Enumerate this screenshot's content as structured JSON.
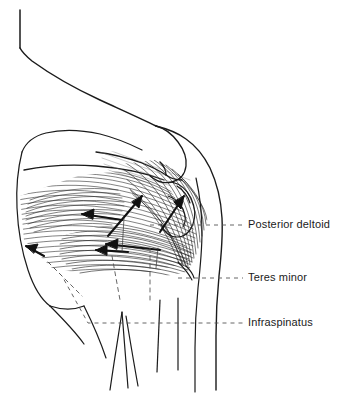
{
  "figure": {
    "background_color": "#ffffff",
    "ink_color": "#1b1b1b",
    "leader_color": "#555555",
    "width": 351,
    "height": 395
  },
  "labels": [
    {
      "id": "posterior-deltoid",
      "text": "Posterior deltoid",
      "x": 248,
      "y": 225
    },
    {
      "id": "teres-minor",
      "text": "Teres minor",
      "x": 248,
      "y": 278
    },
    {
      "id": "infraspinatus",
      "text": "Infraspinatus",
      "x": 248,
      "y": 323
    }
  ],
  "leaders": [
    {
      "id": "leader-posterior-deltoid",
      "target_label": "Posterior deltoid",
      "y": 225,
      "from_x": 150,
      "to_x": 243
    },
    {
      "id": "leader-teres-minor",
      "target_label": "Teres minor",
      "y": 278,
      "from_x": 178,
      "to_x": 243
    },
    {
      "id": "leader-infraspinatus",
      "target_label": "Infraspinatus",
      "y": 323,
      "from_x": 48,
      "to_x": 243
    }
  ],
  "anatomy": {
    "structures": [
      "neck contour",
      "scapula",
      "scapular spine",
      "supraspinous fossa",
      "acromion",
      "humeral head",
      "medial border of scapula",
      "inferior angle of scapula",
      "upper arm contour",
      "posterior deltoid muscle fibers",
      "teres minor muscle fibers",
      "infraspinatus muscle fibers",
      "torso contour lines"
    ],
    "force_arrows": 6
  }
}
